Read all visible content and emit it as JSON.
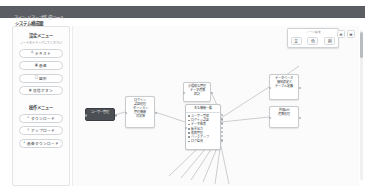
{
  "header": {
    "app_title": "マインドマップ作成ツール",
    "page_subtitle": "システム構成図"
  },
  "sidebar": {
    "sections": [
      {
        "title": "設定メニュー",
        "note": "ノードをドラッグしてください",
        "buttons": [
          {
            "icon": "text-icon",
            "glyph": "A",
            "label": "テキスト"
          },
          {
            "icon": "image-icon",
            "glyph": "▣",
            "label": "画像"
          },
          {
            "icon": "shape-icon",
            "glyph": "□",
            "label": "図形"
          },
          {
            "icon": "button-icon",
            "glyph": "◉",
            "label": "送信ボタン"
          }
        ]
      },
      {
        "title": "操作メニュー",
        "buttons": [
          {
            "icon": "download-icon",
            "glyph": "↓",
            "label": "ダウンロード"
          },
          {
            "icon": "upload-icon",
            "glyph": "↑",
            "label": "アップロード"
          },
          {
            "icon": "image-download-icon",
            "glyph": "↓",
            "label": "画像ダウンロード"
          }
        ]
      }
    ]
  },
  "toolbar": {
    "label": "ノード設定",
    "buttons": [
      {
        "name": "text-style-button",
        "glyph": "文"
      },
      {
        "name": "color-button",
        "glyph": "色"
      },
      {
        "name": "delete-button",
        "glyph": "削"
      }
    ],
    "right_buttons": [
      {
        "name": "zoom-in-button",
        "glyph": "⊕"
      },
      {
        "name": "menu-button",
        "glyph": "≡"
      }
    ]
  },
  "canvas": {
    "nodes": [
      {
        "name": "node-selected",
        "type": "selected",
        "x": 12,
        "y": 82,
        "w": 30,
        "h": 13,
        "text": "ユーザー管理"
      },
      {
        "name": "node-auth",
        "type": "plain",
        "x": 52,
        "y": 70,
        "w": 30,
        "h": 32,
        "text": "ログイン\n認証処理\nセッション\n管理機能\nの実装"
      },
      {
        "name": "node-top-center",
        "type": "plain",
        "x": 110,
        "y": 56,
        "w": 28,
        "h": 20,
        "text": "小規模な管理\nデータ連携\n設計"
      },
      {
        "name": "node-right-upper",
        "type": "plain",
        "x": 196,
        "y": 48,
        "w": 30,
        "h": 26,
        "text": "データベース\n接続設定と\nテーブル定義"
      },
      {
        "name": "node-right-lower",
        "type": "plain",
        "x": 196,
        "y": 80,
        "w": 30,
        "h": 22,
        "text": "外部API\n連携処理"
      }
    ],
    "list_node": {
      "name": "node-feature-list",
      "x": 112,
      "y": 78,
      "w": 36,
      "h": 46,
      "header": "主な機能一覧",
      "items": [
        "ユーザー登録",
        "ログイン認証",
        "データ検索",
        "帳票出力",
        "権限管理",
        "バックアップ",
        "ログ監視"
      ]
    }
  },
  "scrollbar": {
    "name": "vertical-scrollbar"
  }
}
